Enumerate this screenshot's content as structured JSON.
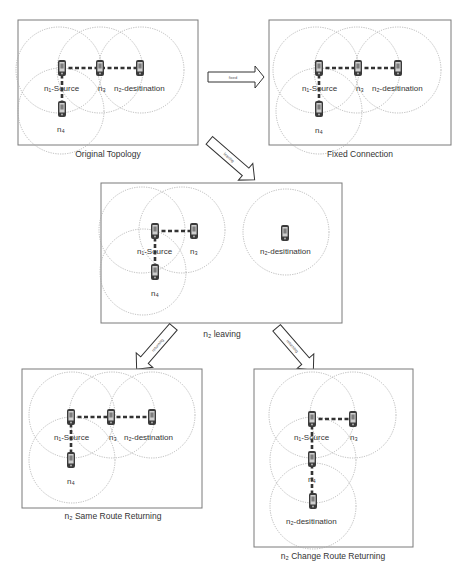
{
  "figure": {
    "panels": [
      {
        "id": "original",
        "caption": "Original Topology",
        "nodes": [
          {
            "id": "n1",
            "label": "n₁-Source"
          },
          {
            "id": "n3",
            "label": "n₃"
          },
          {
            "id": "n2",
            "label": "n₂-desitination"
          },
          {
            "id": "n4",
            "label": "n₄"
          }
        ],
        "links": [
          [
            "n1",
            "n3"
          ],
          [
            "n3",
            "n2"
          ],
          [
            "n1",
            "n4"
          ]
        ]
      },
      {
        "id": "fixed",
        "caption": "Fixed Connection",
        "nodes": [
          {
            "id": "n1",
            "label": "n₁-Source"
          },
          {
            "id": "n3",
            "label": "n₃"
          },
          {
            "id": "n2",
            "label": "n₂-desitination"
          },
          {
            "id": "n4",
            "label": "n₄"
          }
        ],
        "links": [
          [
            "n1",
            "n3"
          ],
          [
            "n3",
            "n2"
          ],
          [
            "n1",
            "n4"
          ]
        ]
      },
      {
        "id": "leaving",
        "caption": "n₂ leaving",
        "nodes": [
          {
            "id": "n1",
            "label": "n₁-Source"
          },
          {
            "id": "n3",
            "label": "n₃"
          },
          {
            "id": "n2",
            "label": "n₂-desitination"
          },
          {
            "id": "n4",
            "label": "n₄"
          }
        ],
        "links": [
          [
            "n1",
            "n3"
          ],
          [
            "n1",
            "n4"
          ]
        ]
      },
      {
        "id": "same-route",
        "caption": "n₂ Same Route Returning",
        "nodes": [
          {
            "id": "n1",
            "label": "n₁-Source"
          },
          {
            "id": "n3",
            "label": "n₃"
          },
          {
            "id": "n2",
            "label": "n₂-destination"
          },
          {
            "id": "n4",
            "label": "n₄"
          }
        ],
        "links": [
          [
            "n1",
            "n3"
          ],
          [
            "n3",
            "n2"
          ],
          [
            "n1",
            "n4"
          ]
        ]
      },
      {
        "id": "change-route",
        "caption": "n₂ Change Route Returning",
        "nodes": [
          {
            "id": "n1",
            "label": "n₁-Source"
          },
          {
            "id": "n3",
            "label": "n₃"
          },
          {
            "id": "n4",
            "label": "n₄"
          },
          {
            "id": "n2",
            "label": "n₂-desitination"
          }
        ],
        "links": [
          [
            "n1",
            "n3"
          ],
          [
            "n1",
            "n4"
          ],
          [
            "n4",
            "n2"
          ]
        ]
      }
    ],
    "arrows": [
      {
        "id": "fixed",
        "label": "fixed",
        "from": "original",
        "to": "fixed"
      },
      {
        "id": "leaving",
        "label": "leaving",
        "from": "original",
        "to": "leaving"
      },
      {
        "id": "returning-same",
        "label": "returning",
        "from": "leaving",
        "to": "same-route"
      },
      {
        "id": "returning-change",
        "label": "returning",
        "from": "leaving",
        "to": "change-route"
      }
    ],
    "colors": {
      "border": "#7a7a7a",
      "range_circle": "#a8a8a8",
      "link": "#333333",
      "node": "#3a3a3a",
      "text": "#333333"
    }
  }
}
